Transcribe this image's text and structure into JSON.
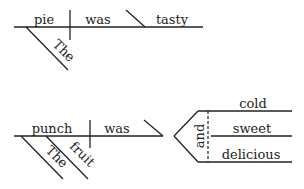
{
  "diagram1": {
    "subject": "pie",
    "verb": "was",
    "complement": "tasty",
    "modifiers": [
      "The"
    ]
  },
  "diagram2": {
    "subject": "punch",
    "verb": "was",
    "conjunction": "and",
    "complements": [
      "cold",
      "sweet",
      "delicious"
    ],
    "modifiers": [
      "The",
      "fruit"
    ]
  }
}
